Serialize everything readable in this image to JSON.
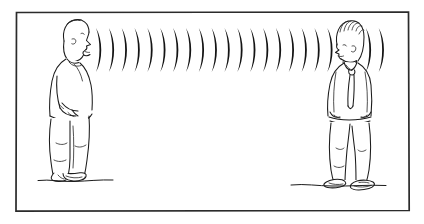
{
  "scene": {
    "title": "Sound waves travelling between a speaking person and a listening person",
    "type": "line-drawing-illustration",
    "background_color": "#ffffff",
    "ink_color": "#1a1a1a",
    "canvas": {
      "width": 424,
      "height": 224
    }
  },
  "frame": {
    "label": "picture-border",
    "stroke_color": "#2b2b2b",
    "x": 15,
    "y": 11,
    "width": 394,
    "height": 200
  },
  "speaker": {
    "label": "speaking-person",
    "description": "Man in profile facing right with open mouth, hand in trouser pocket",
    "facing": "right",
    "head_center_x": 75,
    "head_center_y": 38,
    "ground_y": 181,
    "ground_x_start": 38,
    "ground_x_end": 113
  },
  "listener": {
    "label": "listening-person",
    "description": "Man in profile facing left with wavy hair and necktie, hands at sides",
    "facing": "left",
    "head_center_x": 348,
    "head_center_y": 40,
    "ground_y": 185,
    "ground_x_start": 291,
    "ground_x_end": 386
  },
  "sound_waves": {
    "label": "sound-wave-arcs",
    "description": "Series of nested crescent arcs radiating rightwards from the speaker's mouth",
    "arc_count": 23,
    "first_arc_x": 96,
    "arc_spacing": 12.85,
    "center_y": 50,
    "arc_half_height": 22,
    "fill_color": "#141414"
  }
}
